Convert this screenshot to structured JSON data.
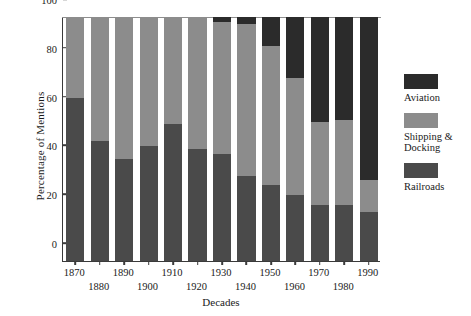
{
  "chart_data": {
    "type": "bar",
    "subtype": "stacked-100-percent",
    "title": "",
    "xlabel": "Decades",
    "ylabel": "Percentage of Mentions",
    "ylim": [
      0,
      100
    ],
    "yticks": [
      0,
      20,
      40,
      60,
      80,
      100
    ],
    "grid": false,
    "legend_position": "right",
    "categories": [
      "1870",
      "1880",
      "1890",
      "1900",
      "1910",
      "1920",
      "1930",
      "1940",
      "1950",
      "1960",
      "1970",
      "1980",
      "1990"
    ],
    "series": [
      {
        "name": "Railroads",
        "color": "#4a4a4a",
        "values": [
          67,
          49,
          42,
          47,
          56,
          46,
          44,
          35,
          31,
          27,
          23,
          23,
          20
        ]
      },
      {
        "name": "Shipping & Docking",
        "color": "#8c8c8c",
        "values": [
          33,
          51,
          58,
          53,
          44,
          54,
          54,
          62,
          57,
          48,
          34,
          35,
          13
        ]
      },
      {
        "name": "Aviation",
        "color": "#2b2b2b",
        "values": [
          0,
          0,
          0,
          0,
          0,
          0,
          2,
          3,
          12,
          25,
          43,
          42,
          67
        ]
      }
    ],
    "stack_order_bottom_to_top": [
      "Railroads",
      "Shipping & Docking",
      "Aviation"
    ],
    "legend_entries": [
      {
        "label": "Aviation",
        "color": "#2b2b2b"
      },
      {
        "label": "Shipping &\nDocking",
        "color": "#8c8c8c"
      },
      {
        "label": "Railroads",
        "color": "#4a4a4a"
      }
    ],
    "axis_color": "#3a3a3a",
    "background": "#ffffff"
  }
}
